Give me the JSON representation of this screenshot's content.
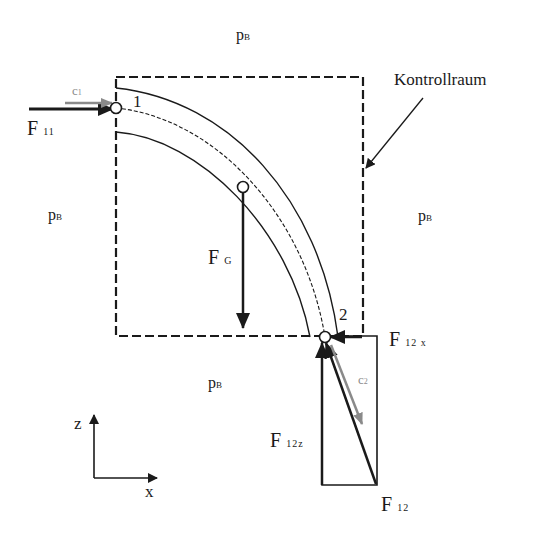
{
  "diagram": {
    "type": "force-diagram-pipe-bend-control-volume",
    "control_volume_label": "Kontrollraum",
    "ambient_pressure": {
      "symbol": "p",
      "subscript": "B"
    },
    "points": [
      {
        "id": "1",
        "label": "1"
      },
      {
        "id": "2",
        "label": "2"
      }
    ],
    "velocities": {
      "c1": {
        "symbol": "c",
        "subscript": "1"
      },
      "c2": {
        "symbol": "c",
        "subscript": "2"
      }
    },
    "forces": {
      "F11": {
        "symbol": "F",
        "subscript": "11"
      },
      "FG": {
        "symbol": "F",
        "subscript": "G"
      },
      "F12x": {
        "symbol": "F",
        "subscript": "12 x"
      },
      "F12z": {
        "symbol": "F",
        "subscript": "12z"
      },
      "F12": {
        "symbol": "F",
        "subscript": "12"
      }
    },
    "axes": {
      "vertical": "z",
      "horizontal": "x"
    },
    "colors": {
      "ink": "#1a1a1a",
      "velocity": "#8a8a8a"
    }
  }
}
